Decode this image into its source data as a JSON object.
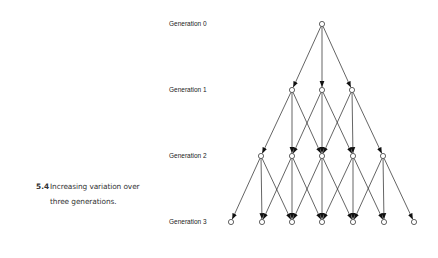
{
  "caption": {
    "number": "5.4",
    "text_line1": "Increasing variation over",
    "text_line2": "three generations."
  },
  "diagram": {
    "generations": [
      {
        "label": "Generation 0",
        "y": 24,
        "nodes_x": [
          322
        ]
      },
      {
        "label": "Generation 1",
        "y": 90,
        "nodes_x": [
          292,
          322,
          352
        ]
      },
      {
        "label": "Generation 2",
        "y": 156,
        "nodes_x": [
          261,
          292,
          322,
          353,
          383
        ]
      },
      {
        "label": "Generation 3",
        "y": 222,
        "nodes_x": [
          231,
          262,
          292,
          322,
          353,
          384,
          414
        ]
      }
    ],
    "edge_rule": "each node connects to the child directly below it and the two adjacent children (left and right)",
    "label_x": 169
  }
}
